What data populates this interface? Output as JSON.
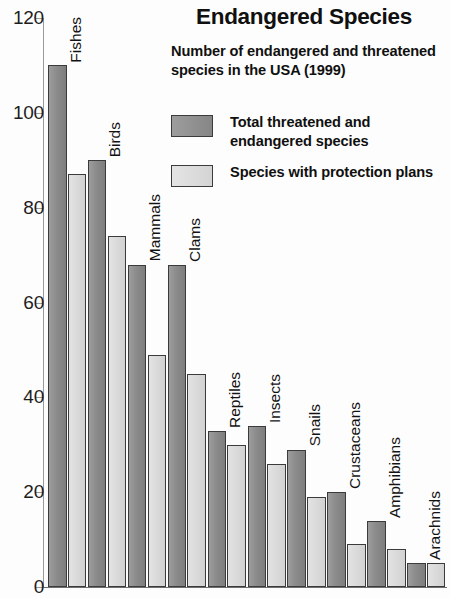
{
  "chart_data": {
    "type": "bar",
    "title": "Endangered Species",
    "subtitle": "Number of endangered and threatened species in the USA (1999)",
    "xlabel": "",
    "ylabel": "",
    "ylim": [
      0,
      120
    ],
    "ytick_step": 20,
    "yticks": [
      "0",
      "20",
      "40",
      "60",
      "80",
      "100",
      "120"
    ],
    "grid": false,
    "legend_position": "top-right",
    "categories": [
      "Fishes",
      "Birds",
      "Mammals",
      "Clams",
      "Reptiles",
      "Insects",
      "Snails",
      "Crustaceans",
      "Amphibians",
      "Arachnids"
    ],
    "series": [
      {
        "name": "Total threatened and endangered species",
        "color": "#8b8b8b",
        "values": [
          110,
          90,
          68,
          68,
          33,
          34,
          29,
          20,
          14,
          5
        ]
      },
      {
        "name": "Species with protection plans",
        "color": "#d8d8d8",
        "values": [
          87,
          74,
          49,
          45,
          30,
          26,
          19,
          9,
          8,
          5
        ]
      }
    ]
  },
  "legend": {
    "items": [
      {
        "label": "Total threatened and endangered species",
        "swatch": "dark"
      },
      {
        "label": "Species with protection plans",
        "swatch": "light"
      }
    ]
  }
}
